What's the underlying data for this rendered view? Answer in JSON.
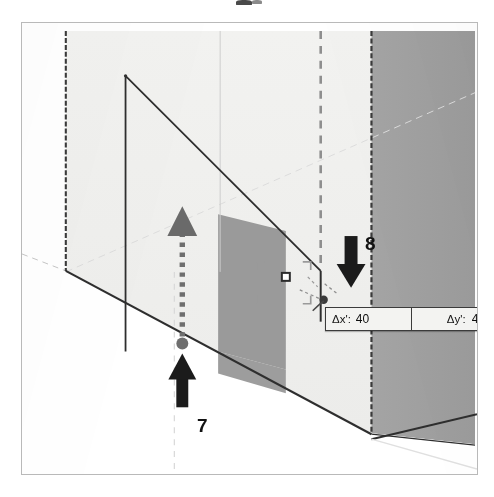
{
  "figure": {
    "scene_name": "isometric-room-interior",
    "colors": {
      "paper": "#ffffff",
      "wall_light": "#efefed",
      "wall_mid": "#e9e9e7",
      "wall_dark": "#a0a0a0",
      "panel_gray": "#999999",
      "outline": "#2e2e2e",
      "inference_dash": "#7a7a7a",
      "faint_line": "#cfcfcf",
      "annotation": "#4a4a4a"
    }
  },
  "measure_box": {
    "name": "measurements-box",
    "dx": {
      "label": "Δx':",
      "value": "40"
    },
    "dy": {
      "label": "Δy':",
      "value": "47,1"
    }
  },
  "annotations": {
    "callout_8": {
      "number": "8",
      "arrow": "arrow-down",
      "points_to": "measurements-box"
    },
    "callout_7": {
      "number": "7",
      "arrow": "arrow-up",
      "points_to": "start-point-dot"
    },
    "drag_arrow": {
      "name": "dashed-drag-arrow-up",
      "style": "dotted",
      "direction": "up"
    }
  }
}
